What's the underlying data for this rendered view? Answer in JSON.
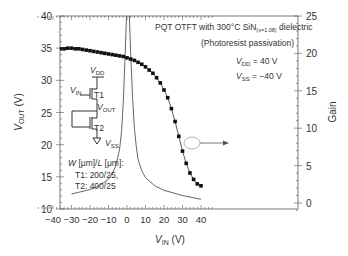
{
  "chart_data": {
    "type": "line",
    "title": "PQT OTFT with 300°C SiN(x=1.08) dielectric",
    "subtitle": "(Photoresist passivation)",
    "xlabel": "V_IN (V)",
    "ylabel_left": "V_OUT (V)",
    "ylabel_right": "Gain",
    "xlim": [
      -48,
      48
    ],
    "ylim_left": [
      10,
      40
    ],
    "ylim_right": [
      -1.5,
      25
    ],
    "x_ticks": [
      -40,
      -30,
      -20,
      -10,
      0,
      10,
      20,
      30,
      40
    ],
    "y_ticks_left": [
      10,
      15,
      20,
      25,
      30,
      35,
      40
    ],
    "y_ticks_right": [
      0,
      5,
      10,
      15,
      20,
      25
    ],
    "grid": false,
    "annotations": [
      "V_DD = 40 V",
      "V_SS = −40 V",
      "W [μm]/L [μm]:",
      "T1: 200/25,",
      "T2: 400/25"
    ],
    "series": [
      {
        "name": "V_OUT",
        "axis": "left",
        "marker": "square",
        "x": [
          -40,
          -38,
          -36,
          -34,
          -32,
          -30,
          -28,
          -26,
          -24,
          -22,
          -20,
          -18,
          -16,
          -14,
          -12,
          -10,
          -8,
          -6,
          -4,
          -2,
          0,
          2,
          4,
          6,
          8,
          10,
          12,
          14,
          16,
          18,
          20,
          22,
          24,
          26,
          28,
          30,
          32,
          34,
          36,
          38,
          40
        ],
        "values": [
          34.8,
          34.8,
          34.9,
          34.9,
          35.0,
          35.0,
          34.9,
          34.9,
          34.8,
          34.7,
          34.6,
          34.5,
          34.4,
          34.3,
          34.2,
          34.1,
          34.0,
          33.9,
          33.8,
          33.7,
          33.5,
          33.3,
          33.1,
          32.8,
          32.5,
          32.1,
          31.6,
          31.1,
          30.4,
          29.6,
          28.5,
          27.3,
          25.6,
          23.6,
          21.3,
          19.0,
          17.1,
          15.6,
          14.6,
          13.9,
          13.6
        ]
      },
      {
        "name": "Gain",
        "axis": "right",
        "marker": "none",
        "x": [
          -30,
          -20,
          -15,
          -10,
          -8,
          -6,
          -4,
          -3,
          -2,
          -1,
          0,
          1,
          2,
          3,
          4,
          5,
          6,
          8,
          10,
          15,
          20,
          30,
          40
        ],
        "values": [
          1.2,
          1.8,
          2.3,
          3.2,
          3.9,
          5.0,
          7.2,
          9.5,
          13.5,
          20,
          27,
          27,
          20,
          14,
          10,
          7.5,
          5.8,
          4.3,
          3.4,
          2.3,
          1.7,
          1.0,
          0.5
        ]
      }
    ]
  }
}
